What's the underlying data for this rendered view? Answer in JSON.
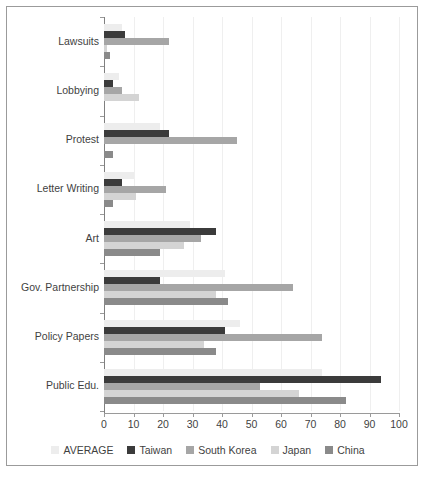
{
  "chart_data": {
    "type": "bar",
    "orientation": "horizontal",
    "title": "",
    "xlabel": "",
    "ylabel": "",
    "xlim": [
      0,
      100
    ],
    "grid": true,
    "legend_position": "bottom",
    "categories": [
      "Lawsuits",
      "Lobbying",
      "Protest",
      "Letter Writing",
      "Art",
      "Gov. Partnership",
      "Policy Papers",
      "Public Edu."
    ],
    "xticks": [
      0,
      10,
      20,
      30,
      40,
      50,
      60,
      70,
      80,
      90,
      100
    ],
    "series": [
      {
        "name": "AVERAGE",
        "color": "#ededed",
        "values": [
          6,
          5,
          19,
          10,
          29,
          41,
          46,
          74
        ]
      },
      {
        "name": "Taiwan",
        "color": "#3b3b3b",
        "values": [
          7,
          3,
          22,
          6,
          38,
          19,
          41,
          94
        ]
      },
      {
        "name": "South Korea",
        "color": "#a6a6a6",
        "values": [
          22,
          6,
          45,
          21,
          33,
          64,
          74,
          53
        ]
      },
      {
        "name": "Japan",
        "color": "#d4d4d4",
        "values": [
          1,
          12,
          0,
          11,
          27,
          38,
          34,
          66
        ]
      },
      {
        "name": "China",
        "color": "#8a8a8a",
        "values": [
          2,
          0,
          3,
          3,
          19,
          42,
          38,
          82
        ]
      }
    ]
  },
  "legend": {
    "items": [
      {
        "label": "AVERAGE",
        "color": "#ededed"
      },
      {
        "label": "Taiwan",
        "color": "#3b3b3b"
      },
      {
        "label": "South Korea",
        "color": "#a6a6a6"
      },
      {
        "label": "Japan",
        "color": "#d4d4d4"
      },
      {
        "label": "China",
        "color": "#8a8a8a"
      }
    ]
  },
  "frame": {
    "border_color": "#9b9b9b",
    "background": "#ffffff"
  }
}
